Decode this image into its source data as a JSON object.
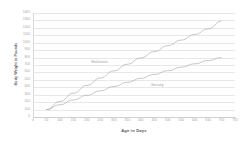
{
  "chart_data": {
    "type": "line",
    "title": "",
    "xlabel": "Age in Days",
    "ylabel": "Body Weight in Pounds",
    "xlim": [
      0,
      750
    ],
    "ylim": [
      0,
      1400
    ],
    "grid": true,
    "legend_position": "inline-annotations",
    "x_ticks": [
      0,
      50,
      100,
      150,
      200,
      250,
      300,
      350,
      400,
      450,
      500,
      550,
      600,
      650,
      700,
      750
    ],
    "y_ticks": [
      0,
      100,
      200,
      300,
      400,
      500,
      600,
      700,
      800,
      900,
      1000,
      1100,
      1200,
      1300,
      1400
    ],
    "x": [
      50,
      100,
      150,
      200,
      250,
      300,
      350,
      400,
      450,
      500,
      550,
      600,
      650,
      700
    ],
    "series": [
      {
        "name": "Holstein",
        "color": "#9a9a9a",
        "label_x": 250,
        "label_y": 760,
        "values": [
          100,
          210,
          320,
          425,
          525,
          620,
          710,
          795,
          880,
          960,
          1035,
          1110,
          1185,
          1290
        ]
      },
      {
        "name": "Jersey",
        "color": "#9a9a9a",
        "label_x": 470,
        "label_y": 450,
        "values": [
          100,
          165,
          230,
          292,
          352,
          410,
          466,
          520,
          572,
          622,
          670,
          716,
          760,
          800
        ]
      }
    ],
    "annotations": [
      {
        "text": "Holstein",
        "x": 250,
        "y": 760
      },
      {
        "text": "Jersey",
        "x": 470,
        "y": 450
      }
    ]
  },
  "colors": {
    "background": "#ffffff",
    "grid": "#e8e8e8",
    "axis": "#d9d9d9",
    "tick_text": "#a6a6a6",
    "title_text": "#595959",
    "series": "#9a9a9a"
  }
}
